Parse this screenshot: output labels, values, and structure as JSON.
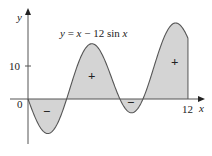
{
  "chart_data": {
    "type": "area",
    "title": "y = x − 12 sin x",
    "xlabel": "x",
    "ylabel": "y",
    "x_ticks": [
      {
        "value": 0,
        "label": "0"
      },
      {
        "value": 12,
        "label": "12"
      }
    ],
    "y_ticks": [
      {
        "value": 10,
        "label": "10"
      }
    ],
    "xlim": [
      -2,
      13.5
    ],
    "ylim": [
      -13,
      30
    ],
    "function": "x - 12*sin(x)",
    "domain": [
      0,
      12
    ],
    "region_signs": [
      {
        "x": 1.4,
        "y": -5,
        "label": "−"
      },
      {
        "x": 3.9,
        "y": 7,
        "label": "+"
      },
      {
        "x": 7.5,
        "y": -1.5,
        "label": "−"
      },
      {
        "x": 10.8,
        "y": 13,
        "label": "+"
      }
    ],
    "fill_color": "#d4d4d4",
    "curve_color": "#555555"
  },
  "labels": {
    "equation_lhs": "y = x − 12 ",
    "equation_sin": "sin",
    "equation_x": " x",
    "y_axis": "y",
    "x_axis": "x",
    "origin": "0",
    "tick_10": "10",
    "tick_12": "12",
    "minus": "−",
    "plus": "+"
  }
}
